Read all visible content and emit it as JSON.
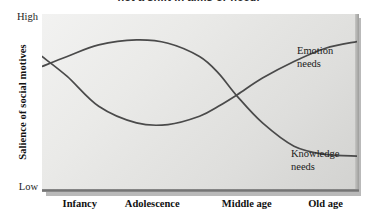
{
  "caption": {
    "clipped_text": "not a shift in aims or need."
  },
  "chart_data": {
    "type": "line",
    "title": "",
    "xlabel": "",
    "ylabel": "Salience of social motives",
    "y_axis": {
      "label": "Salience of social motives",
      "low_label": "Low",
      "high_label": "High",
      "ylim": [
        0,
        100
      ],
      "grid": false
    },
    "x_axis": {
      "categories": [
        "Infancy",
        "Adolescence",
        "Middle age",
        "Old age"
      ],
      "category_positions": [
        0.12,
        0.35,
        0.65,
        0.9
      ],
      "grid": false
    },
    "legend_position": "inline-annotations",
    "series": [
      {
        "name": "Knowledge needs",
        "label_line1": "Knowledge",
        "label_line2": "needs",
        "color": "#4a4a4a",
        "x": [
          0,
          0.08,
          0.18,
          0.3,
          0.4,
          0.5,
          0.56,
          0.62,
          0.7,
          0.8,
          0.9,
          1.0
        ],
        "values": [
          72,
          78,
          85,
          88,
          86,
          78,
          68,
          54,
          38,
          24,
          19,
          18
        ]
      },
      {
        "name": "Emotion needs",
        "label_line1": "Emotion",
        "label_line2": "needs",
        "color": "#4a4a4a",
        "x": [
          0,
          0.08,
          0.18,
          0.3,
          0.4,
          0.5,
          0.56,
          0.62,
          0.7,
          0.8,
          0.9,
          1.0
        ],
        "values": [
          78,
          66,
          48,
          38,
          37,
          42,
          48,
          55,
          65,
          75,
          83,
          87
        ]
      }
    ],
    "crossings": [
      {
        "x_fraction": 0.035,
        "description": "early crossing in infancy"
      },
      {
        "x_fraction": 0.56,
        "description": "crossing at middle age"
      }
    ],
    "annotations": [
      {
        "text": "Emotion needs",
        "target_series": "Emotion needs"
      },
      {
        "text": "Knowledge needs",
        "target_series": "Knowledge needs"
      }
    ]
  },
  "colors": {
    "curve_stroke": "#4a4a4a",
    "panel_light": "#f2f2f1",
    "panel_dark": "#d2d2d0",
    "panel_shadow": "#b9b9b9",
    "baseline": "#6f6f6f",
    "text": "#111111",
    "page_background": "#ffffff"
  }
}
